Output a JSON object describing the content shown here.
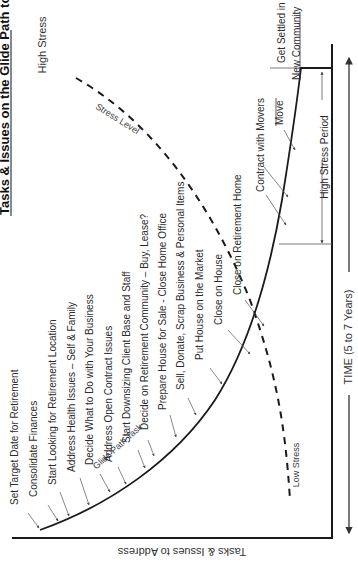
{
  "diagram": {
    "title": "Tasks & Issues on the Glide Path to Retirement",
    "y_axis_label": "Tasks & Issues to Address",
    "x_axis_label": "TIME (5 to 7 Years)",
    "high_stress_label": "High  Stress",
    "low_stress_label": "Low Stress",
    "stress_curve_label": "Stress Level",
    "glide_curve_label": "Glide Path Task",
    "high_stress_period_label": "High Stress Period",
    "tasks": [
      "Set Target Date for Retirement",
      "Consolidate Finances",
      "Start Looking for Retirement Location",
      "Address Health Issues – Self & Family",
      "Decide What to Do with Your Business",
      "Address Open Contract Issues",
      "Start Downsizing Client Base and Staff",
      "Decide on Retirement Community – Buy, Lease?",
      "Prepare House for Sale - Close Home Office",
      "Sell, Donate, Scrap Business & Personal Items",
      "Put House on the Market",
      "Close on House",
      "Close on Retirement Home",
      "Contract with Movers",
      "Move",
      "Get Settled in",
      "New Community"
    ],
    "colors": {
      "line": "#1a1a1a",
      "text": "#2b2b2b",
      "leader": "#555555"
    }
  }
}
